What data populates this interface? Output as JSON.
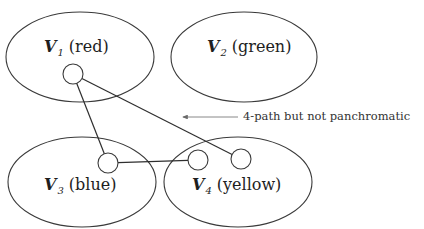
{
  "diagram": {
    "type": "partitioned-graph",
    "partitions": [
      {
        "id": "V1",
        "symbol": "V",
        "subscript": "1",
        "color_name": "(red)",
        "cx": 80,
        "cy": 57,
        "rx": 74,
        "ry": 45,
        "label_x": 44,
        "label_y": 39
      },
      {
        "id": "V2",
        "symbol": "V",
        "subscript": "2",
        "color_name": "(green)",
        "cx": 244,
        "cy": 57,
        "rx": 73,
        "ry": 45,
        "label_x": 207,
        "label_y": 39
      },
      {
        "id": "V3",
        "symbol": "V",
        "subscript": "3",
        "color_name": "(blue)",
        "cx": 82,
        "cy": 182,
        "rx": 74,
        "ry": 45,
        "label_x": 44,
        "label_y": 177
      },
      {
        "id": "V4",
        "symbol": "V",
        "subscript": "4",
        "color_name": "(yellow)",
        "cx": 238,
        "cy": 182,
        "rx": 74,
        "ry": 45,
        "label_x": 192,
        "label_y": 177
      }
    ],
    "vertices": [
      {
        "id": "a",
        "partition": "V1",
        "cx": 73,
        "cy": 74,
        "r": 10
      },
      {
        "id": "b",
        "partition": "V3",
        "cx": 108,
        "cy": 163,
        "r": 10
      },
      {
        "id": "c",
        "partition": "V4",
        "cx": 198,
        "cy": 160,
        "r": 10
      },
      {
        "id": "d",
        "partition": "V4",
        "cx": 241,
        "cy": 159,
        "r": 10
      }
    ],
    "edges": [
      {
        "from": "a",
        "to": "b"
      },
      {
        "from": "b",
        "to": "c"
      },
      {
        "from": "a",
        "to": "d"
      }
    ],
    "annotation": {
      "text": "4-path but not panchromatic",
      "arrow_from": [
        238,
        117
      ],
      "arrow_to": [
        183,
        117
      ],
      "text_x": 243,
      "text_y": 111
    }
  },
  "colors": {
    "stroke": "#3a3a3a",
    "text": "#1e1e1e",
    "annotation_text": "#333333",
    "background": "#ffffff"
  }
}
